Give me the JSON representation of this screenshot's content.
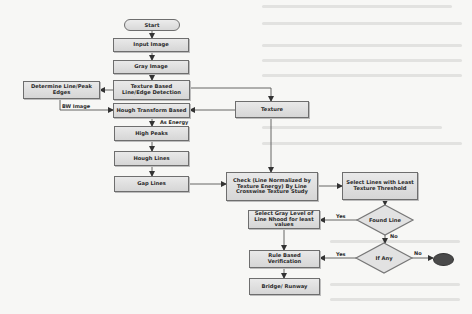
{
  "diagram": {
    "type": "flowchart",
    "nodes": {
      "start": "Start",
      "input_image": "Input Image",
      "gray_image": "Gray Image",
      "texture_based": "Texture Based Line/Edge Detection",
      "determine": "Determine Line/Peak Edges",
      "hough_transform": "Hough Transform Based",
      "texture": "Texture",
      "high_peaks": "High Peaks",
      "hough_lines": "Hough Lines",
      "gap_lines": "Gap Lines",
      "check": "Check (Line Normalized by Texture Energy) By Line Crosswise Texture Study",
      "select_lines": "Select Lines with Least Texture Threshold",
      "found_line": "Found Line",
      "select_gray": "Select Gray Level of Line Nhood for least values",
      "if_any": "If Any",
      "rule_based": "Rule Based Verification",
      "bridge_runway": "Bridge/ Runway"
    },
    "edge_labels": {
      "bw_image": "BW Image",
      "as_energy": "As Energy",
      "found_yes": "Yes",
      "found_no": "No",
      "ifany_yes": "Yes",
      "ifany_no": "No"
    },
    "colors": {
      "box_fill": "#dedede",
      "box_border": "#6e6e6e",
      "arrow": "#333333",
      "end_node": "#4a4a4a",
      "background": "#f7f7f5"
    }
  }
}
